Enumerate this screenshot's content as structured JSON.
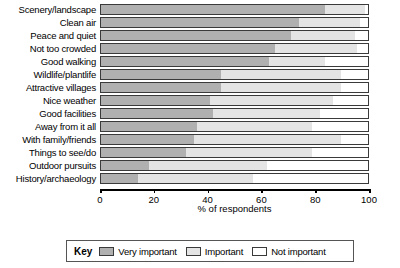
{
  "chart_data": {
    "type": "bar",
    "orientation": "horizontal",
    "stacked": true,
    "title": "",
    "xlabel": "% of respondents",
    "ylabel": "",
    "xlim": [
      0,
      100
    ],
    "xticks": [
      0,
      20,
      40,
      60,
      80,
      100
    ],
    "grid": false,
    "legend_position": "bottom",
    "legend_title": "Key",
    "categories": [
      "Scenery/landscape",
      "Clean air",
      "Peace and quiet",
      "Not too crowded",
      "Good walking",
      "Wildlife/plantlife",
      "Attractive villages",
      "Nice weather",
      "Good facilities",
      "Away from it all",
      "With family/friends",
      "Things to see/do",
      "Outdoor pursuits",
      "History/archaeology"
    ],
    "series": [
      {
        "name": "Very important",
        "color": "#b0b0b0",
        "values": [
          84,
          74,
          71,
          65,
          63,
          45,
          45,
          41,
          42,
          36,
          35,
          32,
          18,
          14
        ]
      },
      {
        "name": "Important",
        "color": "#e4e4e4",
        "values": [
          15,
          23,
          24,
          31,
          21,
          45,
          45,
          46,
          40,
          43,
          55,
          47,
          44,
          43
        ]
      },
      {
        "name": "Not important",
        "color": "#ffffff",
        "values": [
          1,
          3,
          5,
          4,
          16,
          10,
          10,
          13,
          18,
          21,
          10,
          21,
          38,
          43
        ]
      }
    ]
  },
  "legend": {
    "title": "Key",
    "items": [
      {
        "label": "Very important",
        "color": "#b0b0b0"
      },
      {
        "label": "Important",
        "color": "#e4e4e4"
      },
      {
        "label": "Not important",
        "color": "#ffffff"
      }
    ]
  },
  "axis": {
    "x_title": "% of respondents",
    "tick_labels": [
      "0",
      "20",
      "40",
      "60",
      "80",
      "100"
    ]
  }
}
